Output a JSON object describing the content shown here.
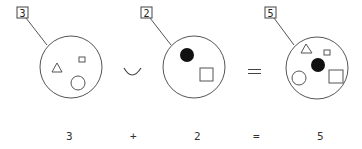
{
  "diagram": {
    "sets": [
      {
        "label": "3",
        "elements": [
          "triangle",
          "small-square",
          "circle"
        ]
      },
      {
        "label": "2",
        "elements": [
          "filled-circle",
          "square"
        ]
      },
      {
        "label": "5",
        "elements": [
          "triangle",
          "small-square",
          "filled-circle",
          "circle",
          "square"
        ]
      }
    ],
    "operators": {
      "union": "∪",
      "equals": "="
    },
    "equation": {
      "a": "3",
      "plus": "+",
      "b": "2",
      "equals": "=",
      "result": "5"
    },
    "colors": {
      "stroke": "#555555",
      "fill": "#000000",
      "background": "#ffffff"
    }
  }
}
